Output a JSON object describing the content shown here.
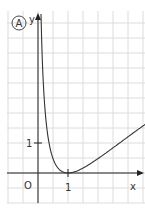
{
  "figure": {
    "panel_label": "A",
    "axis_labels": {
      "x": "x",
      "y": "y"
    },
    "origin_label": "O",
    "x_tick_label": "1",
    "y_tick_label": "1",
    "colors": {
      "grid": "#dcdcdc",
      "axis": "#222222",
      "curve": "#333333"
    }
  },
  "chart_data": {
    "type": "line",
    "title": "",
    "xlabel": "x",
    "ylabel": "y",
    "x": [
      0.1,
      0.2,
      0.3,
      0.5,
      0.7,
      1.0,
      1.5,
      2.0,
      2.5,
      3.0,
      3.5
    ],
    "series": [
      {
        "name": "curve",
        "values": [
          5.3,
          2.59,
          1.45,
          0.48,
          0.13,
          0.0,
          0.16,
          0.48,
          0.84,
          1.21,
          1.57
        ]
      }
    ],
    "xlim": [
      -1,
      3.6
    ],
    "ylim": [
      -1,
      5.4
    ],
    "grid": true,
    "grid_step": 0.5,
    "ticks": {
      "x": [
        1
      ],
      "y": [
        1
      ]
    }
  }
}
